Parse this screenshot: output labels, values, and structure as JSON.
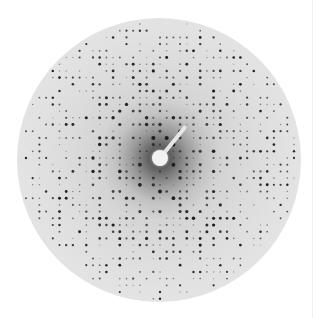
{
  "image": {
    "subject": "X-ray diffraction pattern",
    "width": 318,
    "height": 318,
    "background_color": "#ffffff"
  },
  "detector": {
    "center_x": 159,
    "center_y": 160,
    "radius": 142,
    "plate_color": "#e4e4e4",
    "halo_color": "#3a3a3a"
  },
  "lattice": {
    "origin_x": 160,
    "origin_y": 158,
    "spacing": 6.7,
    "spot_color": "#1a1a1a"
  },
  "beam_stop": {
    "center_x": 160,
    "center_y": 158,
    "radius": 8,
    "arm_end_x": 186,
    "arm_end_y": 126,
    "color": "#f2f2f2"
  },
  "edge_line_x": 312
}
